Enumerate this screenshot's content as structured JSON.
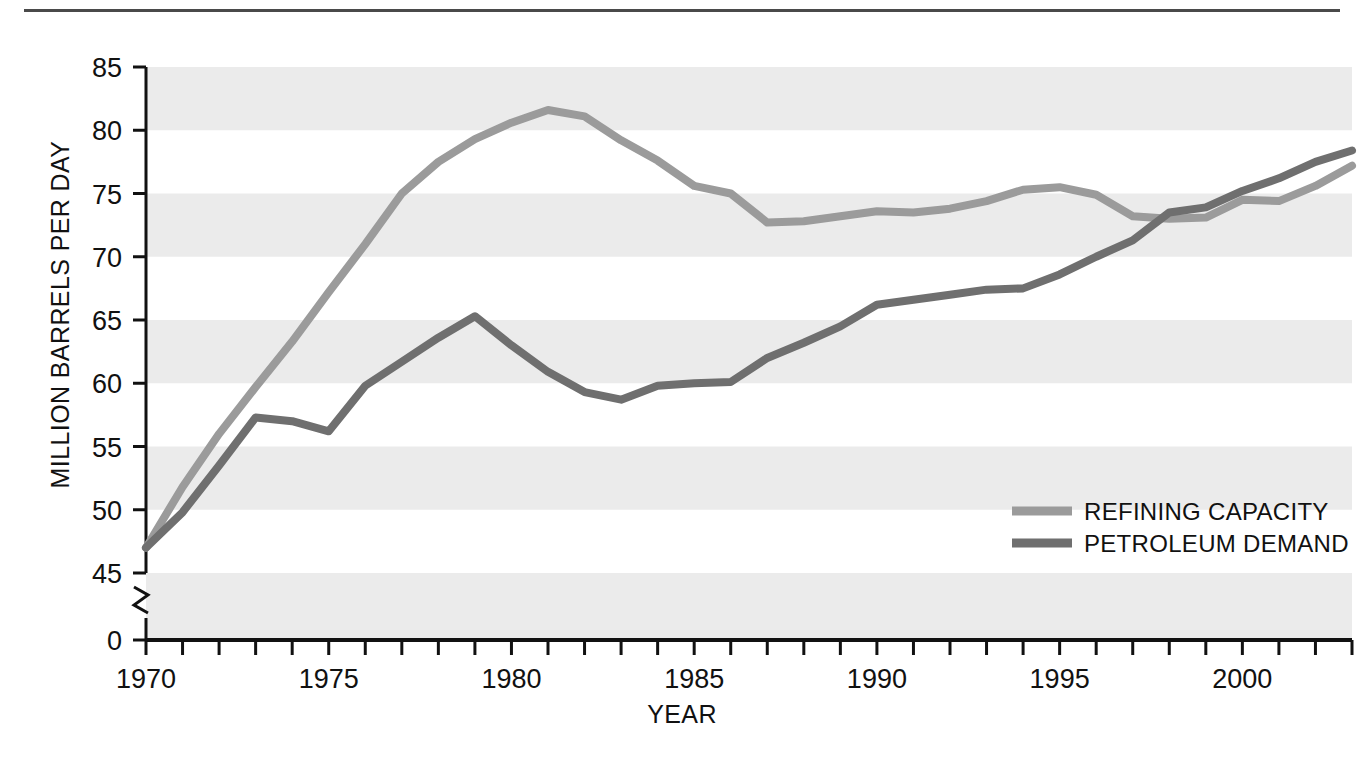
{
  "figure": {
    "top_rule": true,
    "background": "#ffffff"
  },
  "chart_data": {
    "type": "line",
    "title": "",
    "xlabel": "YEAR",
    "ylabel": "MILLION BARRELS PER DAY",
    "xlim": [
      1970,
      2003
    ],
    "ylim": [
      45,
      85
    ],
    "y_axis_break": true,
    "y_break_base_label": "0",
    "yticks": [
      45,
      50,
      55,
      60,
      65,
      70,
      75,
      80,
      85
    ],
    "ytick_labels": [
      "45",
      "50",
      "55",
      "60",
      "65",
      "70",
      "75",
      "80",
      "85"
    ],
    "xticks": [
      1970,
      1975,
      1980,
      1985,
      1990,
      1995,
      2000
    ],
    "xtick_labels": [
      "1970",
      "1975",
      "1980",
      "1985",
      "1990",
      "1995",
      "2000"
    ],
    "minor_xtick_interval": 1,
    "grid": "alternating-horizontal-bands",
    "band_color": "#ebebeb",
    "legend_position": "inside-right-lower",
    "x": [
      1970,
      1971,
      1972,
      1973,
      1974,
      1975,
      1976,
      1977,
      1978,
      1979,
      1980,
      1981,
      1982,
      1983,
      1984,
      1985,
      1986,
      1987,
      1988,
      1989,
      1990,
      1991,
      1992,
      1993,
      1994,
      1995,
      1996,
      1997,
      1998,
      1999,
      2000,
      2001,
      2002,
      2003
    ],
    "series": [
      {
        "name": "REFINING CAPACITY",
        "color": "#9b9b9b",
        "values": [
          47.0,
          51.8,
          56.0,
          59.7,
          63.3,
          67.2,
          71.0,
          75.0,
          77.5,
          79.3,
          80.6,
          81.6,
          81.1,
          79.2,
          77.6,
          75.6,
          75.0,
          72.7,
          72.8,
          73.2,
          73.6,
          73.5,
          73.8,
          74.4,
          75.3,
          75.5,
          74.9,
          73.2,
          73.0,
          73.1,
          74.5,
          74.4,
          75.6,
          77.2
        ]
      },
      {
        "name": "PETROLEUM DEMAND",
        "color": "#6f6f6f",
        "values": [
          47.0,
          49.8,
          53.5,
          57.3,
          57.0,
          56.2,
          59.8,
          61.7,
          63.6,
          65.3,
          63.0,
          60.9,
          59.3,
          58.7,
          59.8,
          60.0,
          60.1,
          62.0,
          63.2,
          64.5,
          66.2,
          66.6,
          67.0,
          67.4,
          67.5,
          68.6,
          70.0,
          71.3,
          73.5,
          73.9,
          75.2,
          76.2,
          77.5,
          78.4
        ]
      }
    ],
    "series_right_end": {
      "REFINING CAPACITY": 82.3,
      "PETROLEUM DEMAND": 82.3
    }
  },
  "legend": {
    "items": [
      {
        "label": "REFINING CAPACITY",
        "color": "#9b9b9b"
      },
      {
        "label": "PETROLEUM DEMAND",
        "color": "#6f6f6f"
      }
    ]
  }
}
